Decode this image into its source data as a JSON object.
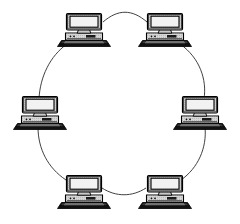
{
  "diagram": {
    "type": "network-topology",
    "topology": "ring",
    "node_count": 6,
    "link_count": 6,
    "background_color": "#ffffff",
    "line_color": "#2b2b2b",
    "canvas": {
      "width": 240,
      "height": 224
    },
    "ring_ellipse": {
      "cx": 121,
      "cy": 112,
      "rx": 84,
      "ry": 82
    },
    "node_label_visible": false,
    "nodes": [
      {
        "id": "node-top-left",
        "name": "computer-top-left",
        "icon": "desktop-computer-icon",
        "label": "",
        "position": {
          "x": 84,
          "y": 29
        },
        "ring_angle_deg": 240
      },
      {
        "id": "node-top-right",
        "name": "computer-top-right",
        "icon": "desktop-computer-icon",
        "label": "",
        "position": {
          "x": 165,
          "y": 29
        },
        "ring_angle_deg": 300
      },
      {
        "id": "node-middle-right",
        "name": "computer-middle-right",
        "icon": "desktop-computer-icon",
        "label": "",
        "position": {
          "x": 200,
          "y": 112
        },
        "ring_angle_deg": 0
      },
      {
        "id": "node-bottom-right",
        "name": "computer-bottom-right",
        "icon": "desktop-computer-icon",
        "label": "",
        "position": {
          "x": 165,
          "y": 191
        },
        "ring_angle_deg": 60
      },
      {
        "id": "node-bottom-left",
        "name": "computer-bottom-left",
        "icon": "desktop-computer-icon",
        "label": "",
        "position": {
          "x": 84,
          "y": 191
        },
        "ring_angle_deg": 120
      },
      {
        "id": "node-middle-left",
        "name": "computer-middle-left",
        "icon": "desktop-computer-icon",
        "label": "",
        "position": {
          "x": 40,
          "y": 112
        },
        "ring_angle_deg": 180
      }
    ],
    "links": [
      {
        "id": "link-1",
        "name": "ring-link-top",
        "from": "node-top-left",
        "to": "node-top-right",
        "label": ""
      },
      {
        "id": "link-2",
        "name": "ring-link-upper-right",
        "from": "node-top-right",
        "to": "node-middle-right",
        "label": ""
      },
      {
        "id": "link-3",
        "name": "ring-link-lower-right",
        "from": "node-middle-right",
        "to": "node-bottom-right",
        "label": ""
      },
      {
        "id": "link-4",
        "name": "ring-link-bottom",
        "from": "node-bottom-right",
        "to": "node-bottom-left",
        "label": ""
      },
      {
        "id": "link-5",
        "name": "ring-link-lower-left",
        "from": "node-bottom-left",
        "to": "node-middle-left",
        "label": ""
      },
      {
        "id": "link-6",
        "name": "ring-link-upper-left",
        "from": "node-middle-left",
        "to": "node-top-left",
        "label": ""
      }
    ],
    "colors": {
      "ring_line": "#2b2b2b",
      "monitor_bezel": "#d2d2d2",
      "monitor_screen": "#f2f2f2",
      "computer_body": "#d8d8d8",
      "keyboard_base": "#111111",
      "outline": "#000000"
    }
  }
}
